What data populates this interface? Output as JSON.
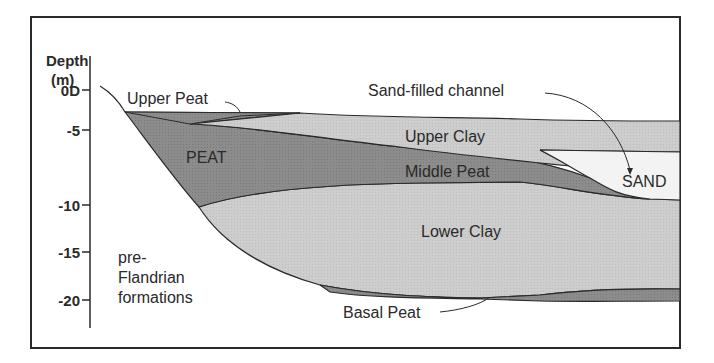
{
  "axis": {
    "label_line1": "Depth",
    "label_line2": "(m)",
    "ticks": [
      "0D",
      "-5",
      "-10",
      "-15",
      "-20"
    ]
  },
  "layers": {
    "upper_peat": "Upper Peat",
    "peat": "PEAT",
    "upper_clay": "Upper Clay",
    "middle_peat": "Middle Peat",
    "sand": "SAND",
    "sand_channel": "Sand-filled channel",
    "lower_clay": "Lower Clay",
    "basal_peat": "Basal Peat",
    "pre_flandrian_1": "pre-",
    "pre_flandrian_2": "Flandrian",
    "pre_flandrian_3": "formations"
  },
  "colors": {
    "peat": "#8a8a8a",
    "clay": "#cbcbcb",
    "sand": "#f2f2f2",
    "line": "#2a2a2a"
  }
}
